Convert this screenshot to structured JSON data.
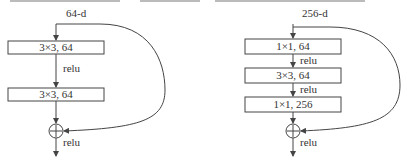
{
  "left_block": {
    "input_label": "64-d",
    "layers": [
      "3×3, 64",
      "3×3, 64"
    ],
    "activation_between": "relu",
    "output_activation": "relu"
  },
  "right_block": {
    "input_label": "256-d",
    "layers": [
      "1×1, 64",
      "3×3, 64",
      "1×1, 256"
    ],
    "activation_between": [
      "relu",
      "relu"
    ],
    "output_activation": "relu"
  },
  "colors": {
    "stroke": "#444444",
    "text": "#333333",
    "background": "#ffffff"
  }
}
